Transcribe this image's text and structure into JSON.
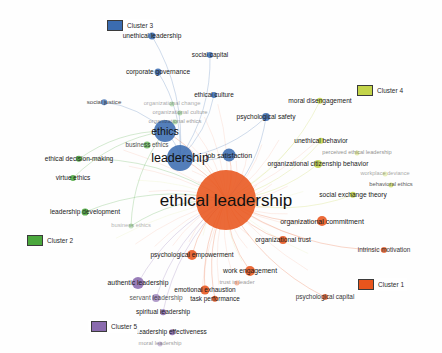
{
  "app": {
    "title": "Ethical Leadership Keyword Co-occurrence Network",
    "canvas": {
      "width": 442,
      "height": 353,
      "background": "#fefefe"
    }
  },
  "legend": {
    "title": "Clusters",
    "items": [
      {
        "id": "cluster-3",
        "label": "Cluster 3",
        "color": "#3b6cb0",
        "x": 104,
        "y": 19
      },
      {
        "id": "cluster-4",
        "label": "Cluster 4",
        "color": "#c3d44a",
        "x": 354,
        "y": 84
      },
      {
        "id": "cluster-2",
        "label": "Cluster 2",
        "color": "#4ba83d",
        "x": 24,
        "y": 234
      },
      {
        "id": "cluster-1",
        "label": "Cluster 1",
        "color": "#e8551d",
        "x": 355,
        "y": 278
      },
      {
        "id": "cluster-5",
        "label": "Cluster 5",
        "color": "#8a6bae",
        "x": 88,
        "y": 320
      }
    ]
  },
  "colors": {
    "cluster_1": "#e8551d",
    "cluster_2": "#4ba83d",
    "cluster_3": "#3b6cb0",
    "cluster_4": "#c3d44a",
    "cluster_5": "#8a6bae",
    "label_text": "#1a1a1a",
    "background": "#fefefe"
  },
  "chart_data": {
    "type": "scatter",
    "xlabel": "",
    "ylabel": "",
    "legend_position": "scattered",
    "grid": false,
    "clusters": [
      {
        "id": 1,
        "name": "Cluster 1",
        "color": "#e8551d"
      },
      {
        "id": 2,
        "name": "Cluster 2",
        "color": "#4ba83d"
      },
      {
        "id": 3,
        "name": "Cluster 3",
        "color": "#3b6cb0"
      },
      {
        "id": 4,
        "name": "Cluster 4",
        "color": "#c3d44a"
      },
      {
        "id": 5,
        "name": "Cluster 5",
        "color": "#8a6bae"
      }
    ],
    "nodes": [
      {
        "label": "ethical leadership",
        "x": 226,
        "y": 200,
        "r": 30,
        "cluster": 1,
        "font": 17,
        "lx": 226,
        "ly": 200,
        "opacity": 1
      },
      {
        "label": "leadership",
        "x": 180,
        "y": 158,
        "r": 13,
        "cluster": 3,
        "font": 12.5,
        "lx": 180,
        "ly": 158,
        "opacity": 1
      },
      {
        "label": "ethics",
        "x": 165,
        "y": 131,
        "r": 11,
        "cluster": 3,
        "font": 10.5,
        "lx": 165,
        "ly": 131,
        "opacity": 1
      },
      {
        "label": "job satisfaction",
        "x": 229,
        "y": 155,
        "r": 6.5,
        "cluster": 3,
        "font": 7,
        "lx": 229,
        "ly": 155,
        "opacity": 1
      },
      {
        "label": "organizational commitment",
        "x": 322,
        "y": 221,
        "r": 5,
        "cluster": 1,
        "font": 7,
        "lx": 322,
        "ly": 221,
        "opacity": 1
      },
      {
        "label": "organizational citizenship behavior",
        "x": 318,
        "y": 164,
        "r": 4,
        "cluster": 4,
        "font": 6.6,
        "lx": 318,
        "ly": 164,
        "opacity": 1
      },
      {
        "label": "psychological empowerment",
        "x": 192,
        "y": 255,
        "r": 5,
        "cluster": 1,
        "font": 6.6,
        "lx": 192,
        "ly": 255,
        "opacity": 1
      },
      {
        "label": "work engagement",
        "x": 250,
        "y": 271,
        "r": 5,
        "cluster": 1,
        "font": 6.8,
        "lx": 250,
        "ly": 271,
        "opacity": 1
      },
      {
        "label": "authentic leadership",
        "x": 138,
        "y": 283,
        "r": 6,
        "cluster": 5,
        "font": 6.8,
        "lx": 138,
        "ly": 283,
        "opacity": 1
      },
      {
        "label": "emotional exhaustion",
        "x": 205,
        "y": 290,
        "r": 4.5,
        "cluster": 1,
        "font": 6.5,
        "lx": 205,
        "ly": 290,
        "opacity": 1
      },
      {
        "label": "organizational trust",
        "x": 283,
        "y": 240,
        "r": 4,
        "cluster": 1,
        "font": 6.6,
        "lx": 283,
        "ly": 240,
        "opacity": 1
      },
      {
        "label": "psychological safety",
        "x": 266,
        "y": 117,
        "r": 4,
        "cluster": 3,
        "font": 6.6,
        "lx": 266,
        "ly": 117,
        "opacity": 1
      },
      {
        "label": "unethical leadership",
        "x": 152,
        "y": 36,
        "r": 3.5,
        "cluster": 3,
        "font": 6.6,
        "lx": 152,
        "ly": 36,
        "opacity": 1
      },
      {
        "label": "corporate governance",
        "x": 158,
        "y": 72,
        "r": 3.5,
        "cluster": 3,
        "font": 6.6,
        "lx": 158,
        "ly": 72,
        "opacity": 1
      },
      {
        "label": "social capital",
        "x": 210,
        "y": 55,
        "r": 3,
        "cluster": 3,
        "font": 6.4,
        "lx": 210,
        "ly": 55,
        "opacity": 1
      },
      {
        "label": "social justice",
        "x": 104,
        "y": 102,
        "r": 2.8,
        "cluster": 3,
        "font": 6.1,
        "lx": 104,
        "ly": 102,
        "opacity": 0.85
      },
      {
        "label": "ethical culture",
        "x": 214,
        "y": 95,
        "r": 3,
        "cluster": 3,
        "font": 6.4,
        "lx": 214,
        "ly": 95,
        "opacity": 1
      },
      {
        "label": "organizational change",
        "x": 172,
        "y": 104,
        "r": 2.6,
        "cluster": 2,
        "font": 5.8,
        "lx": 172,
        "ly": 104,
        "opacity": 0.38
      },
      {
        "label": "organizational culture",
        "x": 180,
        "y": 113,
        "r": 2.6,
        "cluster": 2,
        "font": 5.8,
        "lx": 180,
        "ly": 113,
        "opacity": 0.42
      },
      {
        "label": "organizational ethics",
        "x": 175,
        "y": 122,
        "r": 2.6,
        "cluster": 2,
        "font": 5.8,
        "lx": 175,
        "ly": 122,
        "opacity": 0.45
      },
      {
        "label": "business ethics",
        "x": 147,
        "y": 145,
        "r": 3.5,
        "cluster": 2,
        "font": 6.3,
        "lx": 147,
        "ly": 145,
        "opacity": 0.8
      },
      {
        "label": "ethical decision-making",
        "x": 79,
        "y": 159,
        "r": 3.2,
        "cluster": 2,
        "font": 6.6,
        "lx": 79,
        "ly": 159,
        "opacity": 1
      },
      {
        "label": "virtue ethics",
        "x": 73,
        "y": 178,
        "r": 3,
        "cluster": 2,
        "font": 6.5,
        "lx": 73,
        "ly": 178,
        "opacity": 1
      },
      {
        "label": "leadership development",
        "x": 85,
        "y": 212,
        "r": 3.4,
        "cluster": 2,
        "font": 6.6,
        "lx": 85,
        "ly": 212,
        "opacity": 1
      },
      {
        "label": "business ethics",
        "x": 131,
        "y": 226,
        "r": 2.5,
        "cluster": 2,
        "font": 5.8,
        "lx": 131,
        "ly": 226,
        "opacity": 0.35
      },
      {
        "label": "moral disengagement",
        "x": 320,
        "y": 101,
        "r": 3.2,
        "cluster": 4,
        "font": 6.6,
        "lx": 320,
        "ly": 101,
        "opacity": 1
      },
      {
        "label": "unethical behavior",
        "x": 321,
        "y": 141,
        "r": 3.2,
        "cluster": 4,
        "font": 6.6,
        "lx": 321,
        "ly": 141,
        "opacity": 1
      },
      {
        "label": "perceived ethical leadership",
        "x": 357,
        "y": 153,
        "r": 2.5,
        "cluster": 4,
        "font": 5.6,
        "lx": 357,
        "ly": 153,
        "opacity": 0.5
      },
      {
        "label": "workplace deviance",
        "x": 385,
        "y": 174,
        "r": 2.4,
        "cluster": 4,
        "font": 5.6,
        "lx": 385,
        "ly": 174,
        "opacity": 0.4
      },
      {
        "label": "behavioral ethics",
        "x": 391,
        "y": 185,
        "r": 2.6,
        "cluster": 4,
        "font": 5.8,
        "lx": 391,
        "ly": 185,
        "opacity": 0.75
      },
      {
        "label": "social exchange theory",
        "x": 353,
        "y": 195,
        "r": 3.2,
        "cluster": 4,
        "font": 6.6,
        "lx": 353,
        "ly": 195,
        "opacity": 1
      },
      {
        "label": "intrinsic motivation",
        "x": 384,
        "y": 250,
        "r": 3,
        "cluster": 1,
        "font": 6.4,
        "lx": 384,
        "ly": 250,
        "opacity": 0.9
      },
      {
        "label": "psychological capital",
        "x": 325,
        "y": 297,
        "r": 3,
        "cluster": 1,
        "font": 6.4,
        "lx": 325,
        "ly": 297,
        "opacity": 0.9
      },
      {
        "label": "trust in leader",
        "x": 237,
        "y": 283,
        "r": 2.6,
        "cluster": 1,
        "font": 5.8,
        "lx": 237,
        "ly": 283,
        "opacity": 0.45
      },
      {
        "label": "task performance",
        "x": 215,
        "y": 299,
        "r": 3.2,
        "cluster": 1,
        "font": 6.4,
        "lx": 215,
        "ly": 299,
        "opacity": 1
      },
      {
        "label": "servant leadership",
        "x": 156,
        "y": 298,
        "r": 4,
        "cluster": 5,
        "font": 6.5,
        "lx": 156,
        "ly": 298,
        "opacity": 0.75
      },
      {
        "label": "spiritual leadership",
        "x": 163,
        "y": 312,
        "r": 2.8,
        "cluster": 5,
        "font": 6.5,
        "lx": 163,
        "ly": 312,
        "opacity": 1
      },
      {
        "label": "leadership effectiveness",
        "x": 172,
        "y": 332,
        "r": 2.8,
        "cluster": 5,
        "font": 6.5,
        "lx": 172,
        "ly": 332,
        "opacity": 1
      },
      {
        "label": "moral leadership",
        "x": 160,
        "y": 344,
        "r": 2.5,
        "cluster": 5,
        "font": 5.8,
        "lx": 160,
        "ly": 344,
        "opacity": 0.45
      }
    ],
    "edges": [
      {
        "from": "ethical leadership",
        "to": "leadership",
        "cluster": 1
      },
      {
        "from": "ethical leadership",
        "to": "ethics",
        "cluster": 1
      },
      {
        "from": "ethical leadership",
        "to": "job satisfaction",
        "cluster": 1
      },
      {
        "from": "ethical leadership",
        "to": "organizational commitment",
        "cluster": 1
      },
      {
        "from": "ethical leadership",
        "to": "organizational citizenship behavior",
        "cluster": 4
      },
      {
        "from": "ethical leadership",
        "to": "psychological empowerment",
        "cluster": 1
      },
      {
        "from": "ethical leadership",
        "to": "work engagement",
        "cluster": 1
      },
      {
        "from": "ethical leadership",
        "to": "authentic leadership",
        "cluster": 5
      },
      {
        "from": "ethical leadership",
        "to": "emotional exhaustion",
        "cluster": 1
      },
      {
        "from": "ethical leadership",
        "to": "organizational trust",
        "cluster": 1
      },
      {
        "from": "ethical leadership",
        "to": "psychological safety",
        "cluster": 3
      },
      {
        "from": "ethical leadership",
        "to": "moral disengagement",
        "cluster": 4
      },
      {
        "from": "ethical leadership",
        "to": "unethical behavior",
        "cluster": 4
      },
      {
        "from": "ethical leadership",
        "to": "social exchange theory",
        "cluster": 4
      },
      {
        "from": "ethical leadership",
        "to": "intrinsic motivation",
        "cluster": 1
      },
      {
        "from": "ethical leadership",
        "to": "psychological capital",
        "cluster": 1
      },
      {
        "from": "ethical leadership",
        "to": "task performance",
        "cluster": 1
      },
      {
        "from": "ethical leadership",
        "to": "servant leadership",
        "cluster": 5
      },
      {
        "from": "ethical leadership",
        "to": "spiritual leadership",
        "cluster": 5
      },
      {
        "from": "ethical leadership",
        "to": "business ethics",
        "cluster": 2
      },
      {
        "from": "ethical leadership",
        "to": "leadership development",
        "cluster": 2
      },
      {
        "from": "ethical leadership",
        "to": "ethical decision-making",
        "cluster": 2
      },
      {
        "from": "leadership",
        "to": "ethics",
        "cluster": 3
      },
      {
        "from": "leadership",
        "to": "unethical leadership",
        "cluster": 3
      },
      {
        "from": "leadership",
        "to": "corporate governance",
        "cluster": 3
      },
      {
        "from": "leadership",
        "to": "social capital",
        "cluster": 3
      },
      {
        "from": "leadership",
        "to": "ethical culture",
        "cluster": 3
      },
      {
        "from": "leadership",
        "to": "psychological safety",
        "cluster": 3
      },
      {
        "from": "leadership",
        "to": "job satisfaction",
        "cluster": 3
      },
      {
        "from": "ethics",
        "to": "social justice",
        "cluster": 3
      },
      {
        "from": "ethics",
        "to": "virtue ethics",
        "cluster": 2
      },
      {
        "from": "ethics",
        "to": "ethical decision-making",
        "cluster": 2
      },
      {
        "from": "ethics",
        "to": "business ethics",
        "cluster": 2
      }
    ]
  }
}
